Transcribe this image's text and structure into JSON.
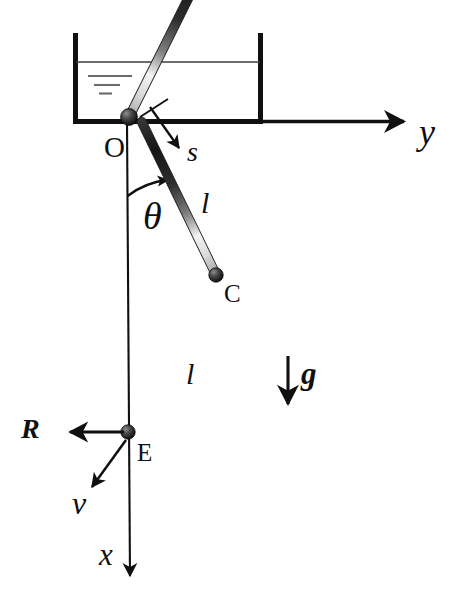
{
  "figure": {
    "type": "mechanics-free-body-diagram",
    "width": 456,
    "height": 606,
    "background_color": "#ffffff",
    "ink_color": "#101010"
  },
  "container": {
    "name": "fluid-tank",
    "left_wall_x": 73,
    "right_wall_x": 262,
    "top_y": 33,
    "bottom_y": 122,
    "wall_thickness": 5,
    "fluid_surface_y": 62,
    "fluid_surface_label": "free-surface-level",
    "hatch_marks": [
      {
        "x1": 88,
        "x2": 132,
        "y": 76
      },
      {
        "x1": 94,
        "x2": 120,
        "y": 85
      },
      {
        "x1": 99,
        "x2": 112,
        "y": 93
      }
    ]
  },
  "axes": [
    {
      "id": "y-axis",
      "label": "y",
      "style": "italic",
      "direction": "right",
      "from": {
        "x": 124,
        "y": 122
      },
      "to": {
        "x": 412,
        "y": 122
      },
      "label_pos": {
        "x": 420,
        "y": 120
      },
      "font_size": 34
    },
    {
      "id": "x-axis",
      "label": "x",
      "style": "italic",
      "direction": "down",
      "from": {
        "x": 124,
        "y": 122
      },
      "to": {
        "x": 130,
        "y": 589
      },
      "label_pos": {
        "x": 100,
        "y": 548
      },
      "font_size": 30
    }
  ],
  "joints": [
    {
      "id": "joint-O",
      "label": "O",
      "x": 129,
      "y": 117,
      "radius": 8,
      "label_pos": {
        "x": 104,
        "y": 135
      },
      "font_size": 29
    },
    {
      "id": "joint-C",
      "label": "C",
      "x": 216,
      "y": 275,
      "radius": 7,
      "label_pos": {
        "x": 225,
        "y": 283
      },
      "font_size": 25
    },
    {
      "id": "joint-E",
      "label": "E",
      "x": 128,
      "y": 432,
      "radius": 7,
      "label_pos": {
        "x": 137,
        "y": 442
      },
      "font_size": 25
    }
  ],
  "links": [
    {
      "id": "link-upper",
      "label": "l",
      "style": "italic",
      "from_joint": "joint-O",
      "to_joint": "joint-C",
      "label_pos": {
        "x": 203,
        "y": 192
      },
      "font_size": 30,
      "thickness": 9
    },
    {
      "id": "link-lower",
      "label": "l",
      "style": "italic",
      "from_joint": "joint-C",
      "to_joint": "joint-E",
      "label_pos": {
        "x": 187,
        "y": 363
      },
      "font_size": 30,
      "thickness": 9
    }
  ],
  "angle": {
    "id": "theta-angle",
    "label": "θ",
    "style": "italic",
    "vertex": {
      "x": 129,
      "y": 117
    },
    "from_direction": "x-axis-downward",
    "to_direction": "link-upper",
    "arc_radius": 78,
    "label_pos": {
      "x": 145,
      "y": 203
    },
    "font_size": 36
  },
  "vectors": [
    {
      "id": "arclength-s",
      "label": "s",
      "style": "italic",
      "description": "arc-length coordinate along upper link",
      "from": {
        "x": 148,
        "y": 106
      },
      "to": {
        "x": 180,
        "y": 150
      },
      "tick_from": {
        "x": 141,
        "y": 116
      },
      "tick_to": {
        "x": 166,
        "y": 100
      },
      "label_pos": {
        "x": 188,
        "y": 143
      },
      "font_size": 28
    },
    {
      "id": "reaction-R",
      "label": "R",
      "style": "bold-italic",
      "description": "reaction force at point E, pointing in the negative y direction",
      "from": {
        "x": 126,
        "y": 432
      },
      "to": {
        "x": 62,
        "y": 432
      },
      "label_pos": {
        "x": 22,
        "y": 420
      },
      "font_size": 28
    },
    {
      "id": "velocity-v",
      "label": "v",
      "style": "italic",
      "description": "velocity of the end point E",
      "from": {
        "x": 126,
        "y": 440
      },
      "to": {
        "x": 88,
        "y": 492
      },
      "label_pos": {
        "x": 74,
        "y": 495
      },
      "font_size": 30
    },
    {
      "id": "gravity-g",
      "label": "g",
      "style": "bold-italic",
      "description": "gravitational acceleration, pointing downward along x",
      "from": {
        "x": 288,
        "y": 356
      },
      "to": {
        "x": 288,
        "y": 414
      },
      "label_pos": {
        "x": 300,
        "y": 365
      },
      "font_size": 30
    }
  ]
}
